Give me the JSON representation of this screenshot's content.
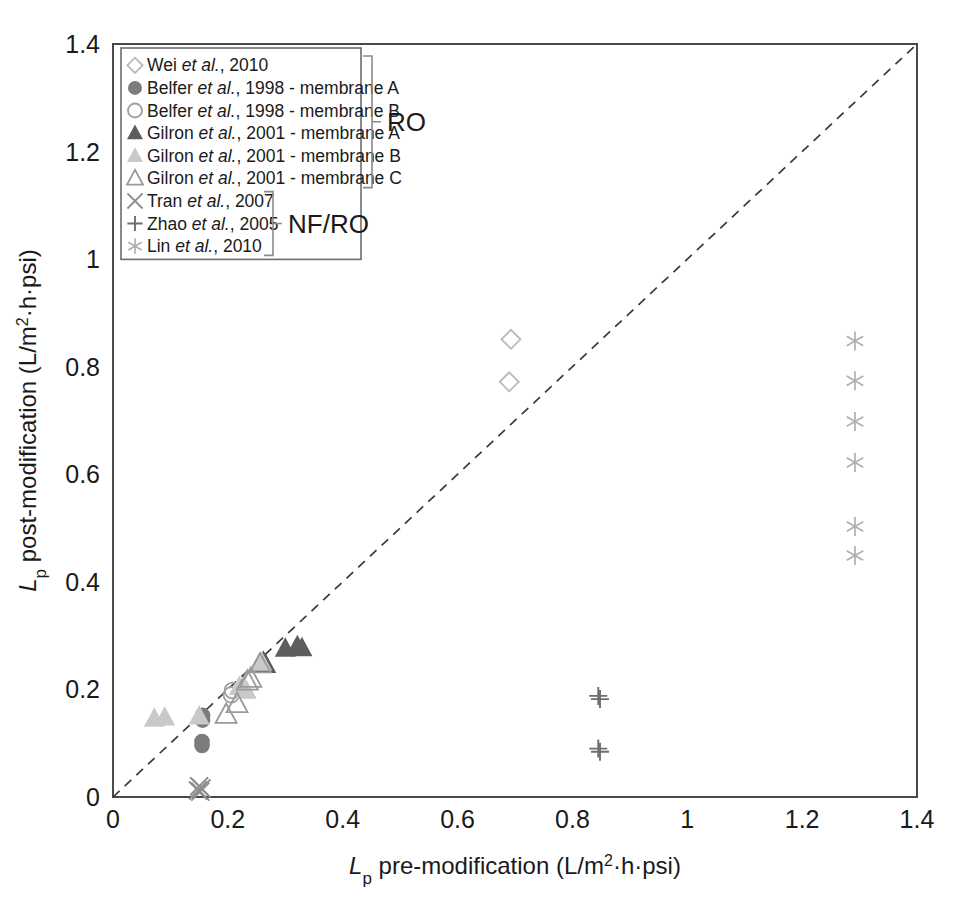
{
  "figure": {
    "title": "",
    "background": "#ffffff"
  },
  "axes": {
    "x_title_prefix": "L",
    "x_title_sub": "p",
    "x_title_rest": " pre-modification (L/m",
    "x_title_sup": "2",
    "x_title_tail": "·h·psi)",
    "y_title_prefix": "L",
    "y_title_sub": "p",
    "y_title_rest": " post-modification (L/m",
    "y_title_sup": "2",
    "y_title_tail": "·h·psi)",
    "x_ticks": [
      "0",
      "0.2",
      "0.4",
      "0.6",
      "0.8",
      "1",
      "1.2",
      "1.4"
    ],
    "y_ticks": [
      "0",
      "0.2",
      "0.4",
      "0.6",
      "0.8",
      "1",
      "1.2",
      "1.4"
    ],
    "xlim": [
      0,
      1.4
    ],
    "ylim": [
      0,
      1.4
    ],
    "grid": false,
    "axis_color": "#4a4a4a"
  },
  "legend": {
    "position": "top-left-inside",
    "items": [
      {
        "marker": "diamond-open",
        "color": "#b9b9b9",
        "author": "Wei ",
        "italic": "et al.",
        "rest": ", 2010"
      },
      {
        "marker": "circle-filled",
        "color": "#7c7c7c",
        "author": "Belfer ",
        "italic": "et al.",
        "rest": ", 1998 - membrane A"
      },
      {
        "marker": "circle-open",
        "color": "#a0a0a0",
        "author": "Belfer ",
        "italic": "et al.",
        "rest": ", 1998 - membrane B"
      },
      {
        "marker": "triangle-filled",
        "color": "#5d5d5d",
        "author": "Gilron ",
        "italic": "et al.",
        "rest": ", 2001 - membrane A"
      },
      {
        "marker": "triangle-filled-light",
        "color": "#c9c9c9",
        "author": "Gilron ",
        "italic": "et al.",
        "rest": ", 2001 - membrane B"
      },
      {
        "marker": "triangle-open",
        "color": "#9a9a9a",
        "author": "Gilron ",
        "italic": "et al.",
        "rest": ", 2001 - membrane C"
      },
      {
        "marker": "cross-x",
        "color": "#8e8e8e",
        "author": "Tran ",
        "italic": "et al.",
        "rest": ", 2007"
      },
      {
        "marker": "plus",
        "color": "#6e6e6e",
        "author": "Zhao ",
        "italic": "et al.",
        "rest": ", 2005"
      },
      {
        "marker": "asterisk",
        "color": "#b0b0b0",
        "author": "Lin ",
        "italic": "et al.",
        "rest": ", 2010"
      }
    ],
    "group_brackets": [
      {
        "label": "RO",
        "first_item": 0,
        "last_item": 5
      },
      {
        "label": "NF/RO",
        "first_item": 6,
        "last_item": 8
      }
    ]
  },
  "chart_data": {
    "type": "scatter",
    "title": "",
    "xlabel": "Lp pre-modification (L/m2·h·psi)",
    "ylabel": "Lp post-modification (L/m2·h·psi)",
    "xlim": [
      0,
      1.4
    ],
    "ylim": [
      0,
      1.4
    ],
    "grid": false,
    "reference_line": {
      "type": "parity",
      "label": "y = x",
      "style": "dashed",
      "from": [
        0,
        0
      ],
      "to": [
        1.4,
        1.4
      ]
    },
    "series": [
      {
        "name": "Wei et al., 2010",
        "marker": "diamond-open",
        "color": "#b9b9b9",
        "points": [
          [
            0.693,
            0.851
          ],
          [
            0.69,
            0.772
          ]
        ]
      },
      {
        "name": "Belfer et al., 1998 - membrane A",
        "marker": "circle-filled",
        "color": "#7c7c7c",
        "points": [
          [
            0.156,
            0.152
          ],
          [
            0.156,
            0.143
          ],
          [
            0.155,
            0.103
          ],
          [
            0.155,
            0.096
          ]
        ]
      },
      {
        "name": "Belfer et al., 1998 - membrane B",
        "marker": "circle-open",
        "color": "#a0a0a0",
        "points": [
          [
            0.208,
            0.198
          ],
          [
            0.206,
            0.19
          ]
        ]
      },
      {
        "name": "Gilron et al., 2001 - membrane A",
        "marker": "triangle-filled",
        "color": "#5d5d5d",
        "points": [
          [
            0.257,
            0.248
          ],
          [
            0.262,
            0.252
          ],
          [
            0.266,
            0.246
          ],
          [
            0.3,
            0.276
          ],
          [
            0.321,
            0.281
          ],
          [
            0.329,
            0.277
          ]
        ]
      },
      {
        "name": "Gilron et al., 2001 - membrane B",
        "marker": "triangle-filled-light",
        "color": "#c9c9c9",
        "points": [
          [
            0.072,
            0.146
          ],
          [
            0.09,
            0.148
          ],
          [
            0.15,
            0.15
          ],
          [
            0.22,
            0.205
          ],
          [
            0.232,
            0.198
          ],
          [
            0.259,
            0.25
          ]
        ]
      },
      {
        "name": "Gilron et al., 2001 - membrane C",
        "marker": "triangle-open",
        "color": "#9a9a9a",
        "points": [
          [
            0.197,
            0.153
          ],
          [
            0.216,
            0.173
          ],
          [
            0.234,
            0.215
          ],
          [
            0.24,
            0.22
          ],
          [
            0.256,
            0.247
          ]
        ]
      },
      {
        "name": "Tran et al., 2007",
        "marker": "cross-x",
        "color": "#8e8e8e",
        "points": [
          [
            0.148,
            0.012
          ],
          [
            0.152,
            0.01
          ],
          [
            0.15,
            0.02
          ],
          [
            0.154,
            0.016
          ]
        ]
      },
      {
        "name": "Zhao et al., 2005",
        "marker": "plus",
        "color": "#6e6e6e",
        "points": [
          [
            0.845,
            0.188
          ],
          [
            0.848,
            0.182
          ],
          [
            0.845,
            0.09
          ],
          [
            0.848,
            0.084
          ]
        ]
      },
      {
        "name": "Lin et al., 2010",
        "marker": "asterisk",
        "color": "#b0b0b0",
        "points": [
          [
            1.292,
            0.848
          ],
          [
            1.292,
            0.774
          ],
          [
            1.292,
            0.698
          ],
          [
            1.292,
            0.622
          ],
          [
            1.292,
            0.503
          ],
          [
            1.292,
            0.449
          ]
        ]
      }
    ]
  }
}
